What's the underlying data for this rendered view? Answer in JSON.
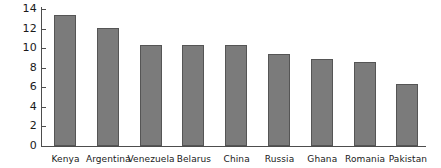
{
  "chart_data": {
    "type": "bar",
    "title": "",
    "subtitle": "",
    "xlabel": "",
    "ylabel": "",
    "categories": [
      "Kenya",
      "Argentina",
      "Venezuela",
      "Belarus",
      "China",
      "Russia",
      "Ghana",
      "Romania",
      "Pakistan"
    ],
    "values": [
      13.4,
      12.05,
      10.35,
      10.35,
      10.3,
      9.4,
      8.9,
      8.6,
      6.35
    ],
    "ylim": [
      0,
      14
    ],
    "y_ticks": [
      0,
      2,
      4,
      6,
      8,
      10,
      12,
      14
    ],
    "y_tick_labels": [
      "0",
      "2",
      "4",
      "6",
      "8",
      "10",
      "12",
      "14"
    ],
    "grid": false,
    "legend": false,
    "legend_position": "none",
    "bar_fill_color": "#7b7b7b",
    "bar_border_color": "#555555",
    "axis_color": "#4d4d4d",
    "background_color": "#ffffff",
    "text_color": "#1a1a1a"
  }
}
